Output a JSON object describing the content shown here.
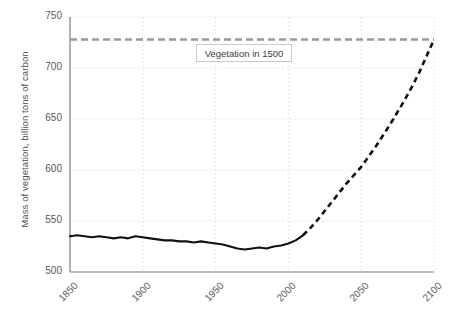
{
  "chart_data": {
    "type": "line",
    "title": "",
    "xlabel": "",
    "ylabel": "Mass of vegetation, billion tons of carbon",
    "xlim": [
      1850,
      2100
    ],
    "ylim": [
      500,
      750
    ],
    "grid": true,
    "legend": "none",
    "xticks": [
      "1850",
      "1900",
      "1950",
      "2000",
      "2050",
      "2100"
    ],
    "xtick_values": [
      1850,
      1900,
      1950,
      2000,
      2050,
      2100
    ],
    "yticks": [
      "500",
      "550",
      "600",
      "650",
      "700",
      "750"
    ],
    "ytick_values": [
      500,
      550,
      600,
      650,
      700,
      750
    ],
    "annotations": [
      {
        "name": "vegetation-1500-label",
        "text": "Vegetation in 1500",
        "x": 1950,
        "y": 707,
        "refers_to": "reference-line"
      }
    ],
    "series": [
      {
        "name": "Historical vegetation mass",
        "style": "solid",
        "color": "#111111",
        "x": [
          1850,
          1855,
          1860,
          1865,
          1870,
          1875,
          1880,
          1885,
          1890,
          1895,
          1900,
          1905,
          1910,
          1915,
          1920,
          1925,
          1930,
          1935,
          1940,
          1945,
          1950,
          1955,
          1960,
          1965,
          1970,
          1975,
          1980,
          1985,
          1990,
          1995,
          2000,
          2005,
          2010
        ],
        "values": [
          535,
          536,
          535,
          534,
          535,
          534,
          533,
          534,
          533,
          535,
          534,
          533,
          532,
          531,
          531,
          530,
          530,
          529,
          530,
          529,
          528,
          527,
          525,
          523,
          522,
          523,
          524,
          523,
          525,
          526,
          528,
          531,
          536
        ]
      },
      {
        "name": "Projected vegetation mass",
        "style": "dashed",
        "color": "#111111",
        "x": [
          2010,
          2015,
          2020,
          2025,
          2030,
          2035,
          2040,
          2045,
          2050,
          2055,
          2060,
          2065,
          2070,
          2075,
          2080,
          2085,
          2090,
          2095,
          2100
        ],
        "values": [
          536,
          543,
          551,
          560,
          569,
          578,
          587,
          595,
          603,
          613,
          623,
          634,
          645,
          657,
          669,
          682,
          696,
          712,
          728
        ]
      },
      {
        "name": "Vegetation in 1500 reference level",
        "style": "dashed",
        "color": "#999999",
        "x": [
          1850,
          2100
        ],
        "values": [
          728,
          728
        ]
      }
    ]
  },
  "axes": {
    "x_tick_labels": [
      "1850",
      "1900",
      "1950",
      "2000",
      "2050",
      "2100"
    ],
    "y_tick_labels": [
      "500",
      "550",
      "600",
      "650",
      "700",
      "750"
    ],
    "y_axis_title": "Mass of vegetation, billion tons of carbon"
  },
  "colors": {
    "data_line": "#111111",
    "reference_line": "#999999",
    "grid": "#d8d8d8",
    "axis": "#808080",
    "text": "#5a5a5a",
    "annotation_border": "#c9c9c9",
    "background": "#ffffff"
  }
}
